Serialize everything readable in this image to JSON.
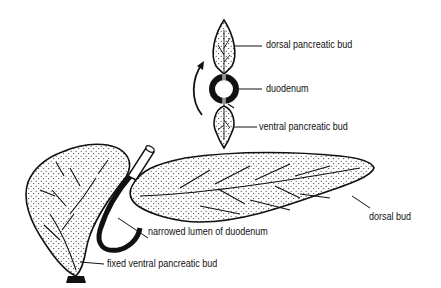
{
  "diagram": {
    "labels": {
      "dorsal_pancreatic_bud": "dorsal pancreatic bud",
      "duodenum": "duodenum",
      "ventral_pancreatic_bud": "ventral pancreatic bud",
      "dorsal_bud": "dorsal bud",
      "narrowed_lumen": "narrowed lumen of duodenum",
      "fixed_ventral_bud": "fixed ventral pancreatic bud"
    },
    "colors": {
      "ink": "#111111",
      "background": "#ffffff"
    }
  }
}
